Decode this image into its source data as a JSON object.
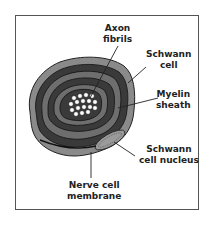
{
  "diagram": {
    "title": "",
    "labels": {
      "axon_fibrils": [
        "Axon",
        "fibrils"
      ],
      "schwann_cell": [
        "Schwann",
        "cell"
      ],
      "myelin_sheath": [
        "Myelin",
        "sheath"
      ],
      "schwann_nucleus": [
        "Schwann",
        "cell nucleus"
      ],
      "nerve_membrane": [
        "Nerve cell",
        "membrane"
      ]
    },
    "colors": {
      "frame": "#555555",
      "outer_cell": "#8a8a8a",
      "myelin_dark": "#3a3a3a",
      "myelin_mid": "#6e6e6e",
      "fibrils": "#ffffff",
      "nucleus": "#9a9a9a",
      "text": "#222222"
    }
  }
}
